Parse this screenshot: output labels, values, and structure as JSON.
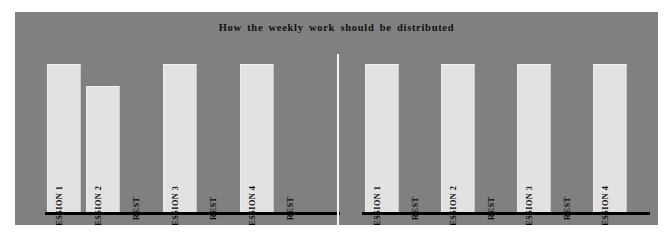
{
  "figure": {
    "title": "How the weekly work should be distributed",
    "background_color": "#808080",
    "bar_color": "#e2e2e2",
    "axis_color": "#000000",
    "divider_color": "#f4f4f4"
  },
  "chart_data": [
    {
      "type": "bar",
      "title": "How the weekly work should be distributed",
      "name": "left-plan",
      "xlabel": "",
      "ylabel": "",
      "grid": false,
      "legend": "none",
      "ylim": [
        0,
        100
      ],
      "categories": [
        "SESSION 1",
        "SESSION 2",
        "REST",
        "SESSION 3",
        "REST",
        "SESSION 4",
        "REST"
      ],
      "values": [
        100,
        85,
        0,
        100,
        0,
        100,
        0
      ]
    },
    {
      "type": "bar",
      "title": "How the weekly work should be distributed",
      "name": "right-plan",
      "xlabel": "",
      "ylabel": "",
      "grid": false,
      "legend": "none",
      "ylim": [
        0,
        100
      ],
      "categories": [
        "SESSION 1",
        "REST",
        "SESSION 2",
        "REST",
        "SESSION 3",
        "REST",
        "SESSION 4"
      ],
      "values": [
        100,
        0,
        100,
        0,
        100,
        0,
        100
      ]
    }
  ]
}
